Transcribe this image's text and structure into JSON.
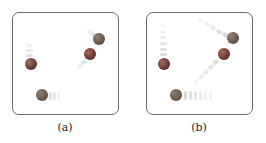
{
  "figure": {
    "panels": [
      {
        "id": "a",
        "caption": "(a)",
        "description": "Four particles with short motion trails (low velocity)",
        "particles": [
          {
            "x": 31,
            "y": 64,
            "color": "#6e3a34",
            "trail_direction": "up",
            "trail_length": "short"
          },
          {
            "x": 89,
            "y": 54,
            "color": "#6e3a34",
            "trail_direction": "down-left",
            "trail_length": "short"
          },
          {
            "x": 100,
            "y": 39,
            "color": "#6f5a4a",
            "trail_direction": "up-left",
            "trail_length": "short"
          },
          {
            "x": 42,
            "y": 95,
            "color": "#6f5a4a",
            "trail_direction": "right",
            "trail_length": "short"
          }
        ]
      },
      {
        "id": "b",
        "caption": "(b)",
        "description": "Four particles with long motion trails (high velocity)",
        "particles": [
          {
            "x": 164,
            "y": 64,
            "color": "#6e3a34",
            "trail_direction": "up",
            "trail_length": "long"
          },
          {
            "x": 224,
            "y": 54,
            "color": "#6e3a34",
            "trail_direction": "down-left",
            "trail_length": "long"
          },
          {
            "x": 233,
            "y": 38,
            "color": "#6f5a4a",
            "trail_direction": "up-left",
            "trail_length": "long"
          },
          {
            "x": 176,
            "y": 95,
            "color": "#6f5a4a",
            "trail_direction": "right",
            "trail_length": "long"
          }
        ]
      }
    ]
  }
}
